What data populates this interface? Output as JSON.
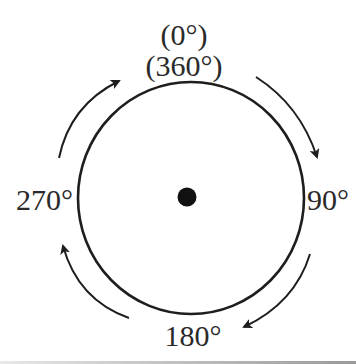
{
  "diagram": {
    "type": "angle-rotation-circle",
    "labels": {
      "top_line1": "(0°)",
      "top_line2": "(360°)",
      "right": "90°",
      "bottom": "180°",
      "left": "270°"
    },
    "rotation_direction": "clockwise",
    "arrows": [
      {
        "id": "top-right",
        "from": "top",
        "to": "right"
      },
      {
        "id": "bottom-right",
        "from": "right",
        "to": "bottom"
      },
      {
        "id": "bottom-left",
        "from": "bottom",
        "to": "left"
      },
      {
        "id": "top-left",
        "from": "left",
        "to": "top"
      }
    ],
    "colors": {
      "stroke": "#1e1e1e",
      "text": "#2a2a2a",
      "background": "#ffffff"
    }
  }
}
